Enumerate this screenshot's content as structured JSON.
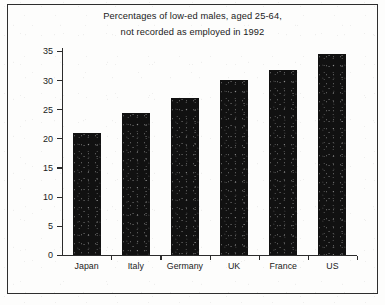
{
  "chart_data": {
    "type": "bar",
    "title": "Percentages of low-ed males, aged 25-64, not recorded as employed in 1992",
    "title_lines": [
      "Percentages of low-ed males, aged 25-64,",
      "not recorded as employed in 1992"
    ],
    "categories": [
      "Japan",
      "Italy",
      "Germany",
      "UK",
      "France",
      "US"
    ],
    "values": [
      21,
      24.3,
      27,
      30.1,
      31.7,
      34.5
    ],
    "xlabel": "",
    "ylabel": "",
    "ylim": [
      0,
      35
    ],
    "ytick_values": [
      0,
      5,
      10,
      15,
      20,
      25,
      30,
      35
    ],
    "ytick_labels": [
      "0",
      "5",
      "10",
      "15",
      "20",
      "25",
      "30",
      "35"
    ],
    "grid": false,
    "legend": false,
    "bar_color": "#111111",
    "axis_color": "#2b2b2b",
    "background_color": "#fdfdfc"
  }
}
